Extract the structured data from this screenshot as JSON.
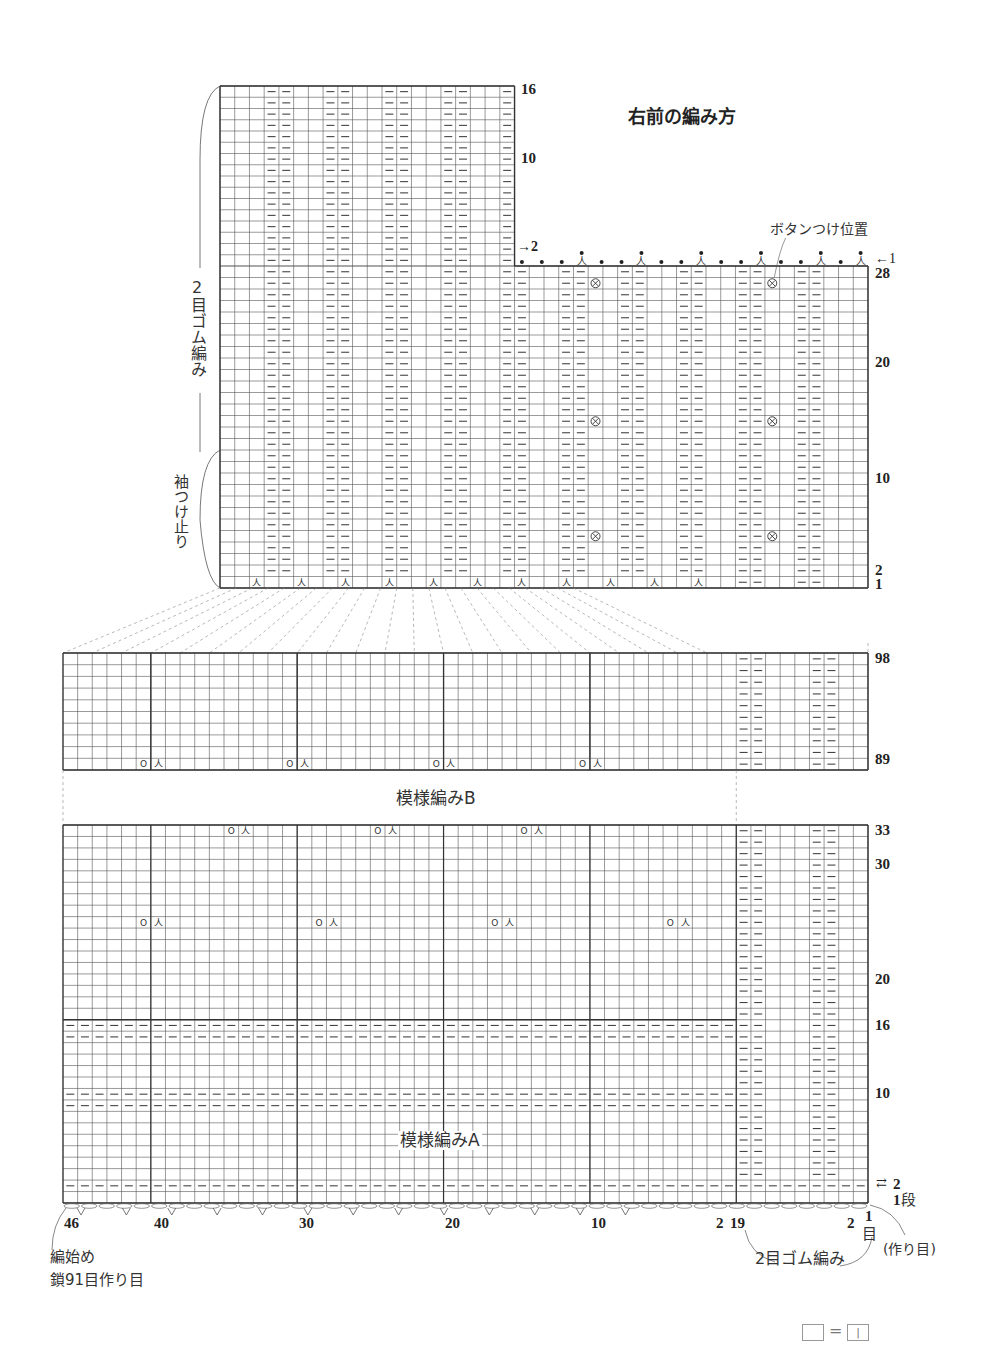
{
  "title": "右前の編み方",
  "labels": {
    "button_position": "ボタンつけ位置",
    "rib_left_vertical": "2目ゴム編み",
    "sleeve_stop": "袖つけ止り",
    "pattern_b": "模様編みB",
    "pattern_a": "模様編みA",
    "start_line1": "編始め",
    "start_line2": "鎖91目作り目",
    "rib_bottom": "2目ゴム編み",
    "cast_on": "(作り目)",
    "stitch_unit": "目",
    "row_unit": "段",
    "legend_equals": "="
  },
  "top_chart": {
    "upper_row_labels": [
      "16",
      "10"
    ],
    "edge_row_labels": [
      "2",
      "1"
    ],
    "right_row_labels": [
      "28",
      "20",
      "10",
      "2",
      "1"
    ],
    "bind_off_symbols": "• • • 人 • • 人 • • 人 • • 人 • • 人 • 人",
    "button_symbol": "⊗",
    "decrease_symbol": "人",
    "purl_symbol": "—"
  },
  "chart_b": {
    "row_labels": [
      "98",
      "89"
    ],
    "yo_symbol": "O",
    "decrease_symbol": "人"
  },
  "chart_a": {
    "row_labels": [
      "33",
      "30",
      "20",
      "16",
      "10",
      "2",
      "1"
    ]
  },
  "bottom_stitch_labels": [
    "46",
    "40",
    "30",
    "20",
    "10",
    "2",
    "19",
    "2",
    "1"
  ],
  "legend": {
    "left_symbol": "blank-square",
    "right_symbol": "knit-stitch-square",
    "right_glyph": "|"
  }
}
